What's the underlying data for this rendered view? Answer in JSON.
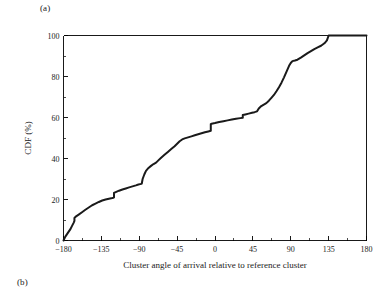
{
  "figure": {
    "panel_a_label": "(a)",
    "panel_b_label": "(b)"
  },
  "chart_data": {
    "type": "line",
    "title": "",
    "subtitle": "",
    "xlabel": "Cluster angle of arrival relative to reference cluster",
    "ylabel": "CDF (%)",
    "xlim": [
      -180,
      180
    ],
    "ylim": [
      0,
      100
    ],
    "xticks": [
      -180,
      -135,
      -90,
      -45,
      0,
      45,
      90,
      135,
      180
    ],
    "xtick_labels": [
      "−180",
      "−135",
      "−90",
      "−45",
      "0",
      "45",
      "90",
      "135",
      "180"
    ],
    "yticks": [
      0,
      20,
      40,
      60,
      80,
      100
    ],
    "ytick_labels": [
      "0",
      "20",
      "40",
      "60",
      "80",
      "100"
    ],
    "x_minor_tick_step": 22.5,
    "y_minor_tick_step": 10,
    "grid": false,
    "legend": null,
    "legend_position": "none",
    "series": [
      {
        "name": "Cluster AoA CDF",
        "color": "#1a1a1a",
        "x": [
          -180,
          -178,
          -175,
          -172,
          -170,
          -168,
          -167,
          -167,
          -165,
          -162,
          -158,
          -154,
          -150,
          -146,
          -142,
          -138,
          -134,
          -130,
          -126,
          -122,
          -121,
          -120,
          -120,
          -118,
          -114,
          -110,
          -106,
          -102,
          -98,
          -94,
          -91,
          -89,
          -88,
          -87,
          -86,
          -84,
          -82,
          -79,
          -76,
          -73,
          -70,
          -67,
          -64,
          -60,
          -56,
          -52,
          -48,
          -45,
          -42,
          -39,
          -36,
          -32,
          -28,
          -24,
          -20,
          -16,
          -12,
          -8,
          -5,
          -5,
          -4,
          0,
          5,
          10,
          15,
          20,
          25,
          30,
          33,
          33,
          36,
          40,
          44,
          47,
          50,
          52,
          55,
          58,
          61,
          64,
          67,
          70,
          73,
          76,
          79,
          82,
          85,
          88,
          90,
          92,
          95,
          98,
          102,
          106,
          110,
          114,
          118,
          122,
          126,
          130,
          133,
          135,
          140,
          150,
          160,
          170,
          180
        ],
        "y": [
          0.0,
          1.8,
          3.6,
          5.4,
          7.0,
          8.6,
          9.6,
          11.0,
          11.8,
          12.6,
          13.8,
          15.0,
          16.1,
          17.2,
          18.0,
          18.8,
          19.5,
          20.0,
          20.4,
          20.7,
          20.8,
          21.0,
          23.2,
          23.6,
          24.3,
          24.9,
          25.4,
          25.9,
          26.4,
          26.9,
          27.3,
          27.5,
          27.6,
          27.8,
          30.0,
          32.2,
          34.0,
          35.4,
          36.4,
          37.3,
          38.0,
          39.2,
          40.4,
          41.8,
          43.2,
          44.6,
          46.0,
          47.2,
          48.4,
          49.3,
          49.8,
          50.3,
          50.8,
          51.3,
          51.8,
          52.3,
          52.8,
          53.2,
          53.5,
          56.8,
          57.0,
          57.3,
          57.8,
          58.2,
          58.6,
          59.0,
          59.4,
          59.7,
          59.9,
          61.2,
          61.5,
          61.9,
          62.3,
          62.6,
          63.0,
          64.4,
          65.6,
          66.3,
          67.0,
          68.2,
          69.6,
          71.0,
          72.8,
          74.8,
          77.0,
          79.6,
          82.4,
          85.2,
          86.6,
          87.5,
          87.8,
          88.2,
          89.2,
          90.3,
          91.4,
          92.4,
          93.4,
          94.2,
          95.0,
          96.2,
          97.6,
          100.0,
          100.0,
          100.0,
          100.0,
          100.0,
          100.0
        ]
      }
    ]
  }
}
